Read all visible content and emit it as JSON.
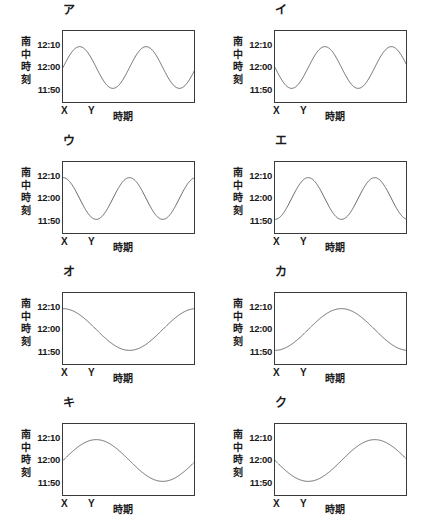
{
  "figure": {
    "type": "multi-panel-line-chart",
    "panel_count": 8,
    "columns": 2,
    "rows": 4,
    "shared_axes": {
      "ylabel": "南中時刻",
      "ylabel_chars": [
        "南",
        "中",
        "時",
        "刻"
      ],
      "xlabel": "時期",
      "yticks": [
        "12:10",
        "12:00",
        "11:50"
      ],
      "ytick_values": [
        730,
        720,
        710
      ],
      "ylim_minutes": [
        706,
        734
      ],
      "xmarks": [
        "X",
        "Y"
      ],
      "xmark_positions": [
        0.0,
        0.2
      ],
      "grid": false,
      "legend": false
    },
    "line_color": "#5a5a5a",
    "frame_color": "#3a3a3a",
    "background": "#ffffff"
  },
  "chart_data": [
    {
      "type": "line",
      "title": "ア",
      "xlabel": "時期",
      "ylabel": "南中時刻",
      "ytick_labels": [
        "12:10",
        "12:00",
        "11:50"
      ],
      "ylim": [
        706,
        734
      ],
      "xlim": [
        0,
        1
      ],
      "xmarks": [
        "X",
        "Y"
      ],
      "grid": false,
      "waveform": {
        "form": "sine",
        "cycles": 2,
        "amplitude_min": 8,
        "midline_min": 720,
        "phase": "rising-from-midline",
        "start_value": "12:00",
        "max_value": "12:08",
        "min_value": "11:52"
      },
      "x": [
        0.0,
        0.05,
        0.1,
        0.15,
        0.2,
        0.25,
        0.3,
        0.35,
        0.4,
        0.45,
        0.5,
        0.55,
        0.6,
        0.65,
        0.7,
        0.75,
        0.8,
        0.85,
        0.9,
        0.95,
        1.0
      ],
      "y": [
        720.0,
        724.7,
        728.5,
        730.9,
        731.6,
        730.5,
        727.8,
        723.9,
        719.4,
        715.1,
        711.6,
        709.3,
        708.5,
        709.4,
        711.8,
        715.4,
        719.7,
        724.2,
        728.1,
        730.8,
        731.7
      ]
    },
    {
      "type": "line",
      "title": "イ",
      "xlabel": "時期",
      "ylabel": "南中時刻",
      "ytick_labels": [
        "12:10",
        "12:00",
        "11:50"
      ],
      "ylim": [
        706,
        734
      ],
      "xlim": [
        0,
        1
      ],
      "xmarks": [
        "X",
        "Y"
      ],
      "grid": false,
      "waveform": {
        "form": "sine",
        "cycles": 2,
        "amplitude_min": 8,
        "midline_min": 720,
        "phase": "falling-from-midline",
        "start_value": "12:00",
        "max_value": "12:08",
        "min_value": "11:52"
      },
      "x": [
        0.0,
        0.05,
        0.1,
        0.15,
        0.2,
        0.25,
        0.3,
        0.35,
        0.4,
        0.45,
        0.5,
        0.55,
        0.6,
        0.65,
        0.7,
        0.75,
        0.8,
        0.85,
        0.9,
        0.95,
        1.0
      ],
      "y": [
        720.0,
        715.3,
        711.5,
        709.1,
        708.4,
        709.5,
        712.2,
        716.1,
        720.6,
        724.9,
        728.4,
        730.7,
        731.5,
        730.6,
        728.2,
        724.6,
        720.3,
        715.8,
        711.9,
        709.2,
        708.3
      ]
    },
    {
      "type": "line",
      "title": "ウ",
      "xlabel": "時期",
      "ylabel": "南中時刻",
      "ytick_labels": [
        "12:10",
        "12:00",
        "11:50"
      ],
      "ylim": [
        706,
        734
      ],
      "xlim": [
        0,
        1
      ],
      "xmarks": [
        "X",
        "Y"
      ],
      "grid": false,
      "waveform": {
        "form": "cosine",
        "cycles": 2,
        "amplitude_min": 8,
        "midline_min": 720,
        "phase": "start-at-maximum",
        "start_value": "12:08",
        "max_value": "12:08",
        "min_value": "11:52"
      },
      "x": [
        0.0,
        0.05,
        0.1,
        0.15,
        0.2,
        0.25,
        0.3,
        0.35,
        0.4,
        0.45,
        0.5,
        0.55,
        0.6,
        0.65,
        0.7,
        0.75,
        0.8,
        0.85,
        0.9,
        0.95,
        1.0
      ],
      "y": [
        728.0,
        726.5,
        722.5,
        717.1,
        712.1,
        709.0,
        708.2,
        710.0,
        714.0,
        719.3,
        724.6,
        728.5,
        730.2,
        729.3,
        726.0,
        721.1,
        715.7,
        711.3,
        708.7,
        708.5,
        710.8
      ]
    },
    {
      "type": "line",
      "title": "エ",
      "xlabel": "時期",
      "ylabel": "南中時刻",
      "ytick_labels": [
        "12:10",
        "12:00",
        "11:50"
      ],
      "ylim": [
        706,
        734
      ],
      "xlim": [
        0,
        1
      ],
      "xmarks": [
        "X",
        "Y"
      ],
      "grid": false,
      "waveform": {
        "form": "cosine",
        "cycles": 2,
        "amplitude_min": 8,
        "midline_min": 720,
        "phase": "start-at-minimum",
        "start_value": "11:52",
        "max_value": "12:08",
        "min_value": "11:52"
      },
      "x": [
        0.0,
        0.05,
        0.1,
        0.15,
        0.2,
        0.25,
        0.3,
        0.35,
        0.4,
        0.45,
        0.5,
        0.55,
        0.6,
        0.65,
        0.7,
        0.75,
        0.8,
        0.85,
        0.9,
        0.95,
        1.0
      ],
      "y": [
        712.0,
        713.5,
        717.5,
        722.9,
        727.9,
        731.0,
        731.8,
        730.0,
        726.0,
        720.7,
        715.4,
        711.5,
        709.8,
        710.7,
        714.0,
        718.9,
        724.3,
        728.7,
        731.3,
        731.5,
        729.2
      ]
    },
    {
      "type": "line",
      "title": "オ",
      "xlabel": "時期",
      "ylabel": "南中時刻",
      "ytick_labels": [
        "12:10",
        "12:00",
        "11:50"
      ],
      "ylim": [
        706,
        734
      ],
      "xlim": [
        0,
        1
      ],
      "xmarks": [
        "X",
        "Y"
      ],
      "grid": false,
      "waveform": {
        "form": "cosine",
        "cycles": 1,
        "amplitude_min": 8,
        "midline_min": 720,
        "phase": "start-at-maximum",
        "start_value": "12:08",
        "max_value": "12:08",
        "min_value": "11:52"
      },
      "x": [
        0.0,
        0.05,
        0.1,
        0.15,
        0.2,
        0.25,
        0.3,
        0.35,
        0.4,
        0.45,
        0.5,
        0.55,
        0.6,
        0.65,
        0.7,
        0.75,
        0.8,
        0.85,
        0.9,
        0.95,
        1.0
      ],
      "y": [
        728.0,
        727.8,
        727.2,
        726.2,
        724.8,
        723.1,
        721.2,
        719.2,
        717.2,
        715.3,
        713.6,
        712.2,
        711.1,
        710.4,
        710.1,
        710.3,
        710.9,
        711.9,
        713.3,
        715.0,
        717.0
      ]
    },
    {
      "type": "line",
      "title": "カ",
      "xlabel": "時期",
      "ylabel": "南中時刻",
      "ytick_labels": [
        "12:10",
        "12:00",
        "11:50"
      ],
      "ylim": [
        706,
        734
      ],
      "xlim": [
        0,
        1
      ],
      "xmarks": [
        "X",
        "Y"
      ],
      "grid": false,
      "waveform": {
        "form": "cosine",
        "cycles": 1,
        "amplitude_min": 8,
        "midline_min": 720,
        "phase": "start-at-minimum",
        "start_value": "11:52",
        "max_value": "12:08",
        "min_value": "11:52"
      },
      "x": [
        0.0,
        0.05,
        0.1,
        0.15,
        0.2,
        0.25,
        0.3,
        0.35,
        0.4,
        0.45,
        0.5,
        0.55,
        0.6,
        0.65,
        0.7,
        0.75,
        0.8,
        0.85,
        0.9,
        0.95,
        1.0
      ],
      "y": [
        712.0,
        712.2,
        712.8,
        713.8,
        715.2,
        716.9,
        718.8,
        720.8,
        722.8,
        724.7,
        726.4,
        727.8,
        728.9,
        729.6,
        729.9,
        729.7,
        729.1,
        728.1,
        726.7,
        725.0,
        723.0
      ]
    },
    {
      "type": "line",
      "title": "キ",
      "xlabel": "時期",
      "ylabel": "南中時刻",
      "ytick_labels": [
        "12:10",
        "12:00",
        "11:50"
      ],
      "ylim": [
        706,
        734
      ],
      "xlim": [
        0,
        1
      ],
      "xmarks": [
        "X",
        "Y"
      ],
      "grid": false,
      "waveform": {
        "form": "sine",
        "cycles": 1,
        "amplitude_min": 8,
        "midline_min": 720,
        "phase": "rising-from-midline",
        "start_value": "12:00",
        "max_value": "12:08",
        "min_value": "11:52"
      },
      "x": [
        0.0,
        0.05,
        0.1,
        0.15,
        0.2,
        0.25,
        0.3,
        0.35,
        0.4,
        0.45,
        0.5,
        0.55,
        0.6,
        0.65,
        0.7,
        0.75,
        0.8,
        0.85,
        0.9,
        0.95,
        1.0
      ],
      "y": [
        720.0,
        722.5,
        724.8,
        726.7,
        728.0,
        728.0,
        727.3,
        725.7,
        723.5,
        720.9,
        718.0,
        715.2,
        712.9,
        711.2,
        710.2,
        710.1,
        710.9,
        712.5,
        714.7,
        717.3,
        720.0
      ]
    },
    {
      "type": "line",
      "title": "ク",
      "xlabel": "時期",
      "ylabel": "南中時刻",
      "ytick_labels": [
        "12:10",
        "12:00",
        "11:50"
      ],
      "ylim": [
        706,
        734
      ],
      "xlim": [
        0,
        1
      ],
      "xmarks": [
        "X",
        "Y"
      ],
      "grid": false,
      "waveform": {
        "form": "sine",
        "cycles": 1,
        "amplitude_min": 8,
        "midline_min": 720,
        "phase": "falling-from-midline",
        "start_value": "12:00",
        "max_value": "12:08",
        "min_value": "11:52"
      },
      "x": [
        0.0,
        0.05,
        0.1,
        0.15,
        0.2,
        0.25,
        0.3,
        0.35,
        0.4,
        0.45,
        0.5,
        0.55,
        0.6,
        0.65,
        0.7,
        0.75,
        0.8,
        0.85,
        0.9,
        0.95,
        1.0
      ],
      "y": [
        720.0,
        717.5,
        715.2,
        713.3,
        712.0,
        712.0,
        712.7,
        714.3,
        716.5,
        719.1,
        722.0,
        724.8,
        727.1,
        728.8,
        729.8,
        729.9,
        729.1,
        727.5,
        725.3,
        722.7,
        720.0
      ]
    }
  ]
}
